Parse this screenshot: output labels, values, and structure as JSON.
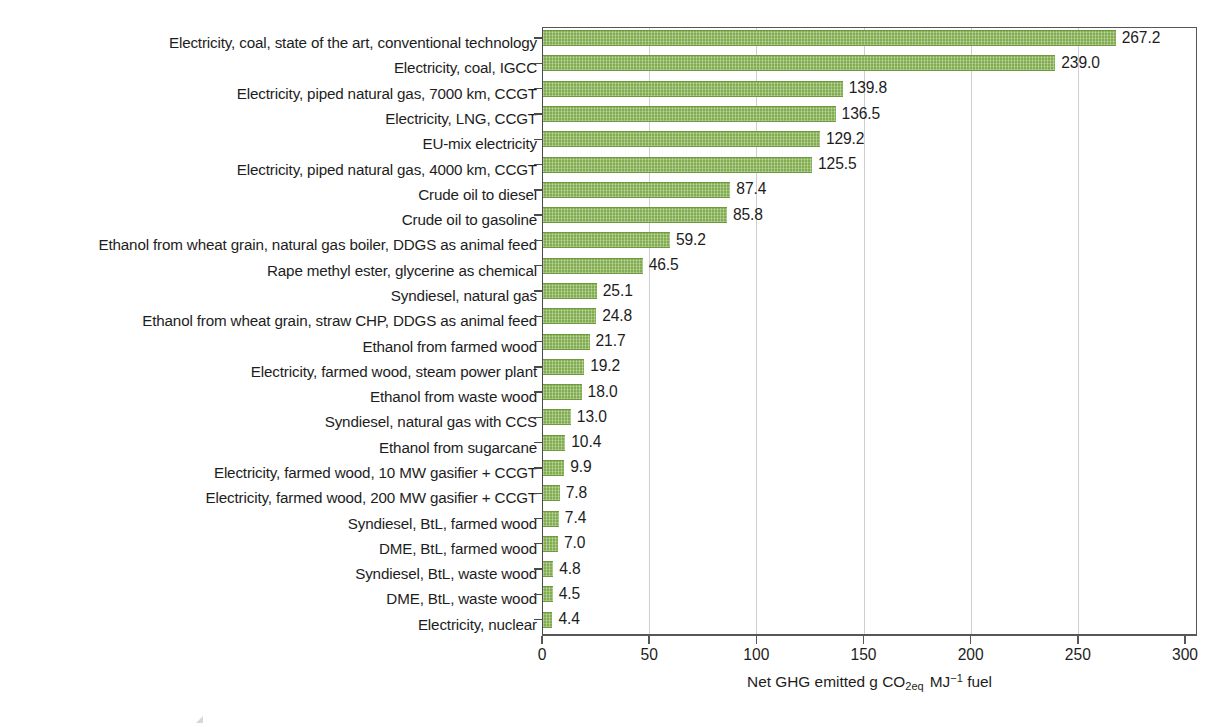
{
  "chart_data": {
    "type": "bar",
    "orientation": "horizontal",
    "title": "",
    "subtitle": "",
    "xlabel": "Net GHG emitted g CO2eq MJ-1 fuel",
    "xlabel_parts": {
      "pre": "Net GHG emitted g CO",
      "sub1": "2eq",
      "mid": "MJ",
      "sup1": "−1",
      "post": "fuel"
    },
    "ylabel": "",
    "xlim": [
      0,
      300
    ],
    "xticks": [
      0,
      50,
      100,
      150,
      200,
      250,
      300
    ],
    "xtick_labels": [
      "0",
      "50",
      "100",
      "150",
      "200",
      "250",
      "300"
    ],
    "grid": "vertical-only",
    "legend": "none",
    "bar_color": "#82ad4e",
    "bar_edge_color": "#6e9a40",
    "categories": [
      "Electricity, coal, state of the art, conventional technology",
      "Electricity, coal, IGCC",
      "Electricity, piped natural gas, 7000 km, CCGT",
      "Electricity, LNG, CCGT",
      "EU-mix electricity",
      "Electricity, piped natural gas, 4000 km, CCGT",
      "Crude oil to diesel",
      "Crude oil to gasoline",
      "Ethanol from wheat grain, natural gas boiler, DDGS as animal feed",
      "Rape methyl ester, glycerine as chemical",
      "Syndiesel, natural gas",
      "Ethanol from wheat grain, straw CHP, DDGS as animal feed",
      "Ethanol from farmed wood",
      "Electricity, farmed wood, steam power plant",
      "Ethanol from waste wood",
      "Syndiesel, natural gas with CCS",
      "Ethanol from sugarcane",
      "Electricity, farmed wood, 10 MW gasifier + CCGT",
      "Electricity, farmed wood, 200 MW gasifier + CCGT",
      "Syndiesel, BtL, farmed wood",
      "DME, BtL, farmed wood",
      "Syndiesel, BtL, waste wood",
      "DME, BtL, waste wood",
      "Electricity, nuclear"
    ],
    "values": [
      267.2,
      239.0,
      139.8,
      136.5,
      129.2,
      125.5,
      87.4,
      85.8,
      59.2,
      46.5,
      25.1,
      24.8,
      21.7,
      19.2,
      18.0,
      13.0,
      10.4,
      9.9,
      7.8,
      7.4,
      7.0,
      4.8,
      4.5,
      4.4
    ],
    "value_labels": [
      "267.2",
      "239.0",
      "139.8",
      "136.5",
      "129.2",
      "125.5",
      "87.4",
      "85.8",
      "59.2",
      "46.5",
      "25.1",
      "24.8",
      "21.7",
      "19.2",
      "18.0",
      "13.0",
      "10.4",
      "9.9",
      "7.8",
      "7.4",
      "7.0",
      "4.8",
      "4.5",
      "4.4"
    ]
  }
}
